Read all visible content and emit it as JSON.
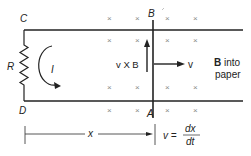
{
  "diagram": {
    "type": "moving-bar-on-rails-emf",
    "labels": {
      "corner_top_left": "C",
      "corner_bottom_left": "D",
      "bar_top": "B",
      "bar_bottom": "A",
      "resistor": "R",
      "current": "I",
      "force_label": "v X B",
      "velocity": "v",
      "field_bold": "B",
      "field_text1": " into",
      "field_text2": "paper",
      "distance": "x",
      "velocity_eq_lhs": "v =",
      "velocity_eq_num": "dx",
      "velocity_eq_den": "dt"
    },
    "field_marker": "×",
    "field_marker_positions": [
      [
        110,
        19
      ],
      [
        138,
        19
      ],
      [
        168,
        19
      ],
      [
        196,
        19
      ],
      [
        110,
        41
      ],
      [
        138,
        41
      ],
      [
        168,
        41
      ],
      [
        196,
        41
      ],
      [
        110,
        88
      ],
      [
        138,
        88
      ],
      [
        168,
        88
      ],
      [
        196,
        88
      ],
      [
        110,
        111
      ],
      [
        138,
        111
      ],
      [
        168,
        111
      ],
      [
        196,
        111
      ]
    ],
    "colors": {
      "line": "#222222",
      "field_marker": "#888888"
    }
  }
}
